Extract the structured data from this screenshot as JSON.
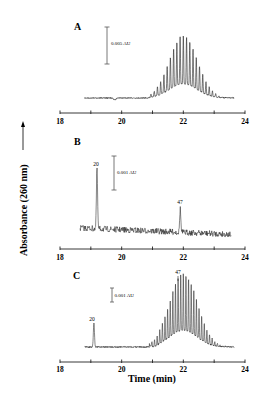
{
  "figure": {
    "y_axis_label": "Absorbance (260 nm)",
    "x_axis_label": "Time (min)"
  },
  "chart_data": [
    {
      "type": "line",
      "panel": "A",
      "title": "A",
      "xlabel": "Time (min)",
      "ylabel": "Absorbance (260 nm)",
      "xlim": [
        18,
        24
      ],
      "xticks": [
        18,
        19,
        20,
        21,
        22,
        23,
        24
      ],
      "xtick_labels": [
        "18",
        "20",
        "22",
        "24"
      ],
      "scale_bar": "0.005 AU",
      "grid": false,
      "description": "Flat baseline from ~18.8 to ~21 min, then a comb of ~25 regularly spaced oligomer peaks forming a Gaussian envelope centered at ~22.0 min, returning to baseline by ~23.6 min.",
      "envelope": {
        "center_min": 22.0,
        "width_sd_min": 0.45,
        "height_AU": 0.0085,
        "start_min": 21.0,
        "end_min": 23.6
      },
      "peak_labels": []
    },
    {
      "type": "line",
      "panel": "B",
      "title": "B",
      "xlabel": "Time (min)",
      "ylabel": "Absorbance (260 nm)",
      "xlim": [
        18,
        24
      ],
      "xticks": [
        18,
        19,
        20,
        21,
        22,
        23,
        24
      ],
      "xtick_labels": [
        "18",
        "20",
        "22",
        "24"
      ],
      "scale_bar": "0.001 AU",
      "grid": false,
      "description": "Noisy baseline from ~18.6 to ~23.5 min with two sharp marker peaks.",
      "peaks": [
        {
          "label": "20",
          "time_min": 19.2,
          "height_AU": 0.0018
        },
        {
          "label": "47",
          "time_min": 21.9,
          "height_AU": 0.0007
        }
      ]
    },
    {
      "type": "line",
      "panel": "C",
      "title": "C",
      "xlabel": "Time (min)",
      "ylabel": "Absorbance (260 nm)",
      "xlim": [
        18,
        24
      ],
      "xticks": [
        18,
        19,
        20,
        21,
        22,
        23,
        24
      ],
      "xtick_labels": [
        "18",
        "20",
        "22",
        "24"
      ],
      "scale_bar": "0.001 AU",
      "grid": false,
      "description": "Sharp marker peak '20' at ~19.1 min, then a comb of regularly spaced oligomer peaks under a Gaussian envelope centered at ~22.0 min; marker '47' indicated near the envelope maximum.",
      "peaks": [
        {
          "label": "20",
          "time_min": 19.1,
          "height_AU": 0.0022
        },
        {
          "label": "47",
          "time_min": 21.85,
          "height_AU": 0.0062
        }
      ],
      "envelope": {
        "center_min": 22.0,
        "width_sd_min": 0.45,
        "height_AU": 0.0065,
        "start_min": 21.0,
        "end_min": 23.6
      }
    }
  ],
  "panels": [
    {
      "label": "A",
      "scale": "0.005 AU",
      "ticks": [
        "18",
        "20",
        "22",
        "24"
      ]
    },
    {
      "label": "B",
      "scale": "0.001 AU",
      "ticks": [
        "18",
        "20",
        "22",
        "24"
      ],
      "peaks": [
        "20",
        "47"
      ]
    },
    {
      "label": "C",
      "scale": "0.001 AU",
      "ticks": [
        "18",
        "20",
        "22",
        "24"
      ],
      "peaks": [
        "20",
        "47"
      ]
    }
  ]
}
